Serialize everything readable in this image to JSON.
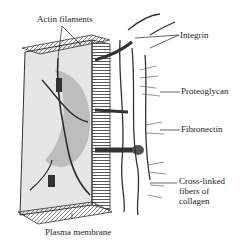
{
  "diagram": {
    "labels": {
      "actin_filaments": "Actin filaments",
      "integrin": "Integrin",
      "proteoglycan": "Proteoglycan",
      "fibronectin": "Fibronectin",
      "collagen_line1": "Cross-linked",
      "collagen_line2": "fibers of",
      "collagen_line3": "collagen",
      "plasma_membrane": "Plasma membrane"
    },
    "colors": {
      "ink": "#222222",
      "shade_dark": "#3a3a3a",
      "shade_mid": "#8a8a8a",
      "shade_light": "#d4d4d4",
      "paper": "#ffffff"
    }
  }
}
